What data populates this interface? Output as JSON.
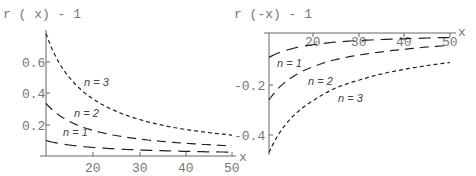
{
  "chart_data": [
    {
      "type": "line",
      "title": "r ( x) - 1",
      "xlabel": "x",
      "ylabel": "r ( x) - 1",
      "xlim": [
        10,
        50
      ],
      "ylim": [
        0,
        0.8
      ],
      "xticks": [
        "20",
        "30",
        "40",
        "50"
      ],
      "yticks": [
        "0.2",
        "0.4",
        "0.6"
      ],
      "grid": false,
      "x": [
        10,
        15,
        20,
        25,
        30,
        35,
        40,
        45,
        50
      ],
      "series": [
        {
          "name": "n = 1",
          "dash": "long",
          "values": [
            0.1,
            0.071,
            0.055,
            0.046,
            0.039,
            0.034,
            0.03,
            0.027,
            0.025
          ]
        },
        {
          "name": "n = 2",
          "dash": "medium",
          "values": [
            0.34,
            0.224,
            0.166,
            0.132,
            0.11,
            0.094,
            0.082,
            0.073,
            0.065
          ]
        },
        {
          "name": "n = 3",
          "dash": "short",
          "values": [
            0.79,
            0.507,
            0.37,
            0.29,
            0.236,
            0.199,
            0.171,
            0.151,
            0.135
          ]
        }
      ]
    },
    {
      "type": "line",
      "title": "r (-x) - 1",
      "xlabel": "x",
      "ylabel": "r (-x) - 1",
      "xlim": [
        10,
        50
      ],
      "ylim": [
        -0.48,
        0
      ],
      "xticks": [
        "20",
        "30",
        "40",
        "50"
      ],
      "yticks": [
        "-0.2",
        "-0.4"
      ],
      "grid": false,
      "x": [
        10,
        15,
        20,
        25,
        30,
        35,
        40,
        45,
        50
      ],
      "series": [
        {
          "name": "n = 1",
          "dash": "long",
          "values": [
            -0.09,
            -0.055,
            -0.038,
            -0.028,
            -0.022,
            -0.018,
            -0.015,
            -0.012,
            -0.01
          ]
        },
        {
          "name": "n = 2",
          "dash": "medium",
          "values": [
            -0.26,
            -0.17,
            -0.125,
            -0.097,
            -0.08,
            -0.067,
            -0.057,
            -0.048,
            -0.042
          ]
        },
        {
          "name": "n = 3",
          "dash": "short",
          "values": [
            -0.47,
            -0.33,
            -0.26,
            -0.21,
            -0.18,
            -0.155,
            -0.137,
            -0.122,
            -0.11
          ]
        }
      ]
    }
  ],
  "left": {
    "title": "r ( x) - 1",
    "xaxis_label": "x",
    "xticks": [
      "20",
      "30",
      "40",
      "50"
    ],
    "yticks": [
      "0.2",
      "0.4",
      "0.6"
    ],
    "labels": [
      "n = 1",
      "n = 2",
      "n = 3"
    ]
  },
  "right": {
    "title": "r (-x) - 1",
    "xaxis_label": "x",
    "xticks": [
      "20",
      "30",
      "40",
      "50"
    ],
    "yticks": [
      "-0.2",
      "-0.4"
    ],
    "labels": [
      "n = 1",
      "n = 2",
      "n = 3"
    ]
  }
}
